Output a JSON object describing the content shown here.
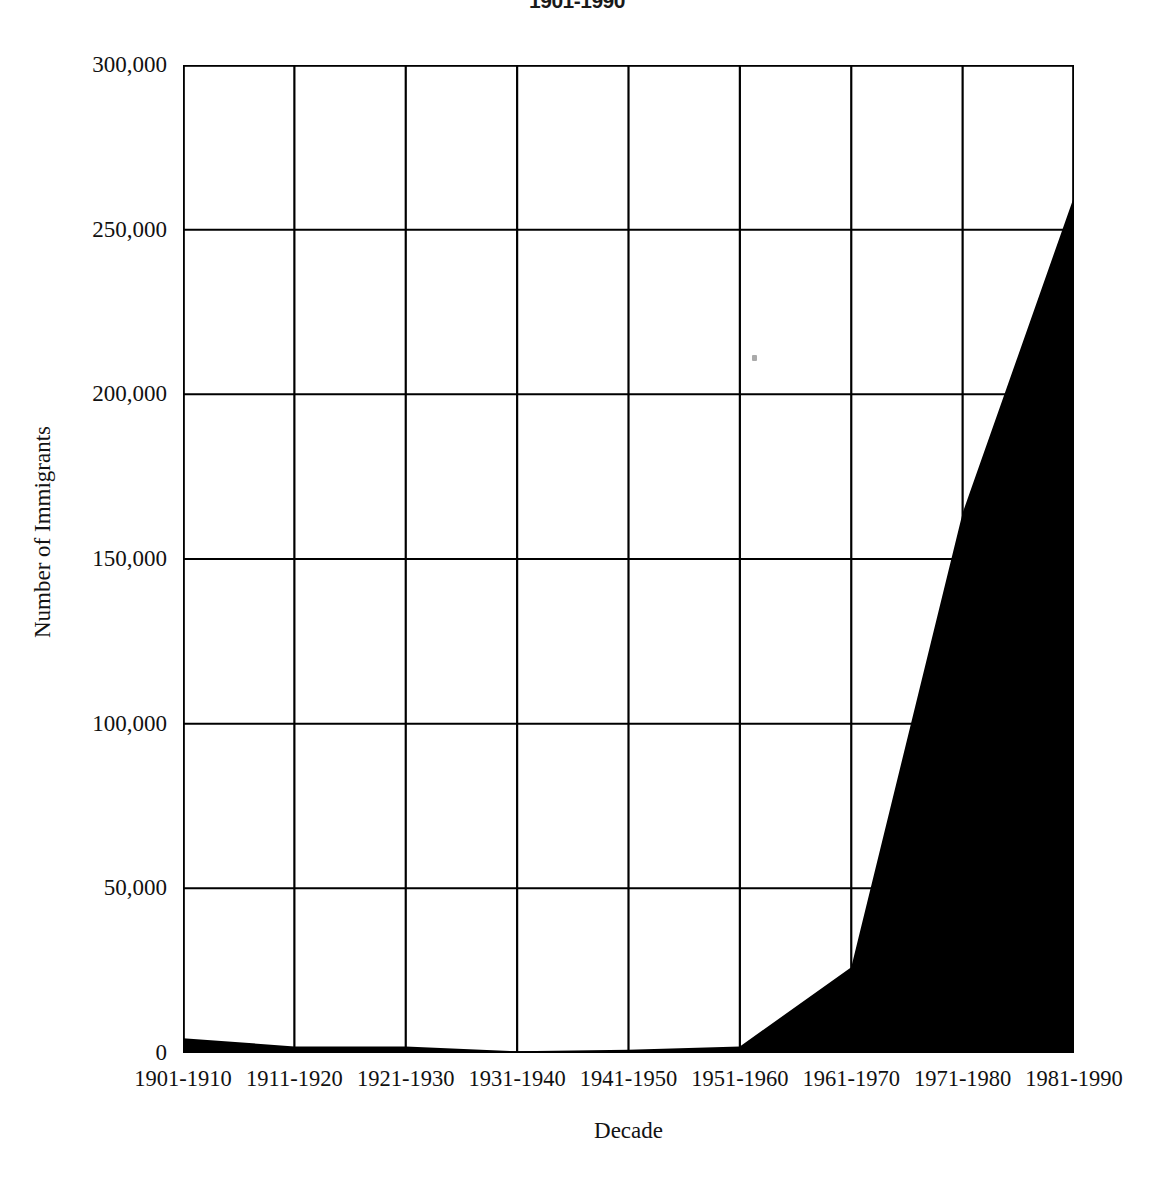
{
  "chart_data": {
    "type": "area",
    "title": "1901-1990",
    "xlabel": "Decade",
    "ylabel": "Number of Immigrants",
    "categories": [
      "1901-1910",
      "1911-1920",
      "1921-1930",
      "1931-1940",
      "1941-1950",
      "1951-1960",
      "1961-1970",
      "1971-1980",
      "1981-1990"
    ],
    "values": [
      4500,
      2000,
      2000,
      500,
      1000,
      2000,
      26000,
      164000,
      260000
    ],
    "series": [
      {
        "name": "Number of Immigrants",
        "values": [
          4500,
          2000,
          2000,
          500,
          1000,
          2000,
          26000,
          164000,
          260000
        ]
      }
    ],
    "ylim": [
      0,
      300000
    ],
    "ytick_values": [
      0,
      50000,
      100000,
      150000,
      200000,
      250000,
      300000
    ],
    "ytick_labels": [
      "0",
      "50,000",
      "100,000",
      "150,000",
      "200,000",
      "250,000",
      "300,000"
    ],
    "y_minor_tick_interval": 10000,
    "grid": "both",
    "legend": "none",
    "fill_color": "#000000",
    "axis_color": "#000000",
    "background_color": "#ffffff"
  },
  "figure": {
    "title_text": "1901-1990",
    "x_axis_title": "Decade",
    "y_axis_title": "Number of Immigrants"
  }
}
